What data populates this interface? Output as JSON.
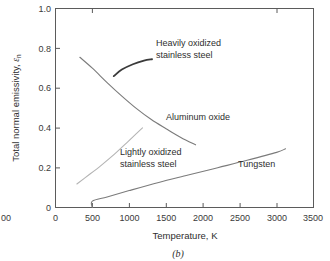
{
  "chart_data": {
    "type": "line",
    "title": "",
    "caption": "(b)",
    "xlabel": "Temperature, K",
    "ylabel_prefix": "Total normal emissivity, ",
    "ylabel_symbol": "ε",
    "ylabel_subscript": "n",
    "xlim": [
      0,
      3500
    ],
    "ylim": [
      0,
      1.0
    ],
    "xticks": [
      0,
      500,
      1000,
      1500,
      2000,
      2500,
      3000,
      3500
    ],
    "xticklabels": [
      "0",
      "500",
      "1000",
      "1500",
      "2000",
      "2500",
      "3000",
      "3500"
    ],
    "yticks": [
      0,
      0.2,
      0.4,
      0.6,
      0.8,
      1.0
    ],
    "yticklabels": [
      "0",
      "0.2",
      "0.4",
      "0.6",
      "0.8",
      "1.0"
    ],
    "grid": false,
    "legend_position": "inline-annotations",
    "series": [
      {
        "name": "Aluminum oxide",
        "color": "#7b7b7b",
        "width": 1.1,
        "x": [
          330,
          500,
          700,
          900,
          1100,
          1300,
          1500,
          1700,
          1900
        ],
        "y": [
          0.755,
          0.7,
          0.628,
          0.56,
          0.497,
          0.442,
          0.396,
          0.352,
          0.315
        ]
      },
      {
        "name": "Lightly oxidized stainless steel",
        "color": "#b4b4b4",
        "width": 1.1,
        "x": [
          290,
          450,
          620,
          800,
          980,
          1100,
          1180
        ],
        "y": [
          0.118,
          0.163,
          0.212,
          0.268,
          0.33,
          0.372,
          0.4
        ]
      },
      {
        "name": "Tungsten",
        "color": "#7b7b7b",
        "width": 1.1,
        "x": [
          500,
          500,
          700,
          1000,
          1400,
          1800,
          2200,
          2600,
          3000,
          3120
        ],
        "y": [
          0.0,
          0.032,
          0.053,
          0.085,
          0.126,
          0.163,
          0.2,
          0.237,
          0.277,
          0.295
        ]
      },
      {
        "name": "Heavily oxidized stainless steel",
        "color": "#3a3a3a",
        "width": 1.8,
        "x": [
          790,
          900,
          1050,
          1200,
          1310
        ],
        "y": [
          0.66,
          0.693,
          0.72,
          0.738,
          0.745
        ]
      }
    ],
    "annotations": [
      {
        "text_line1": "Heavily oxidized",
        "text_line2": "stainless steel",
        "x_px": 156,
        "y_px": 45
      },
      {
        "text_line1": "Aluminum oxide",
        "text_line2": "",
        "x_px": 167,
        "y_px": 117
      },
      {
        "text_line1": "Lightly oxidized",
        "text_line2": "stainless steel",
        "x_px": 120,
        "y_px": 152
      },
      {
        "text_line1": "Tungsten",
        "text_line2": "",
        "x_px": 238,
        "y_px": 164
      }
    ],
    "clipped_neighbor_label": "00"
  }
}
